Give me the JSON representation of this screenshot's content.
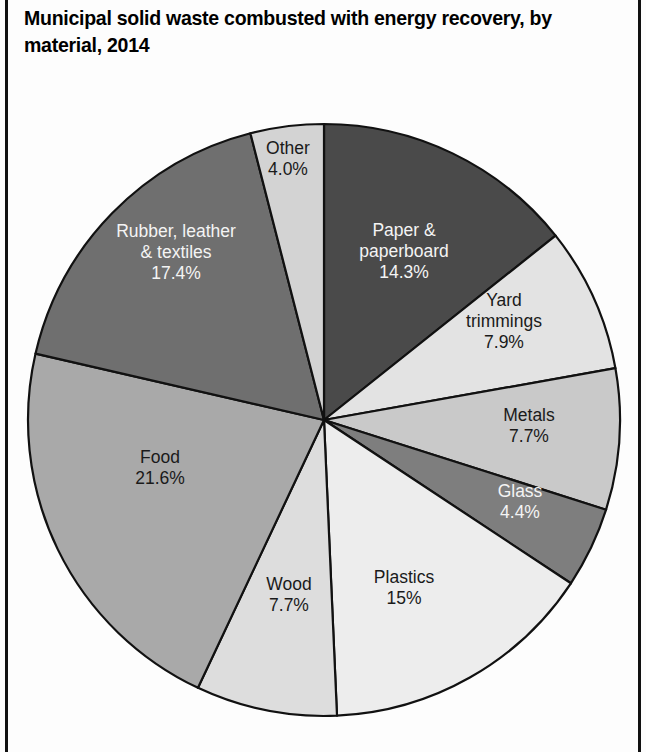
{
  "title": "Municipal solid waste combusted with energy recovery, by material, 2014",
  "chart_data": {
    "type": "pie",
    "title": "Municipal solid waste combusted with energy recovery, by material, 2014",
    "xlabel": "",
    "ylabel": "",
    "legend": "none",
    "start_angle_deg": 0,
    "direction": "clockwise",
    "units": "percent",
    "categories": [
      "Paper & paperboard",
      "Yard trimmings",
      "Metals",
      "Glass",
      "Plastics",
      "Wood",
      "Food",
      "Rubber, leather & textiles",
      "Other"
    ],
    "values": [
      14.3,
      7.9,
      7.7,
      4.4,
      15.0,
      7.7,
      21.6,
      17.4,
      4.0
    ],
    "slices": [
      {
        "name": "Paper & paperboard",
        "label_lines": [
          "Paper &",
          "paperboard"
        ],
        "value": 14.3,
        "value_label": "14.3%",
        "color": "#4a4a4a",
        "text_color": "light",
        "label_x": 404,
        "label_y": 252
      },
      {
        "name": "Yard trimmings",
        "label_lines": [
          "Yard",
          "trimmings"
        ],
        "value": 7.9,
        "value_label": "7.9%",
        "color": "#e3e3e3",
        "text_color": "dark",
        "label_x": 504,
        "label_y": 322
      },
      {
        "name": "Metals",
        "label_lines": [
          "Metals"
        ],
        "value": 7.7,
        "value_label": "7.7%",
        "color": "#c9c9c9",
        "text_color": "dark",
        "label_x": 529,
        "label_y": 426
      },
      {
        "name": "Glass",
        "label_lines": [
          "Glass"
        ],
        "value": 4.4,
        "value_label": "4.4%",
        "color": "#7e7e7e",
        "text_color": "light",
        "label_x": 520,
        "label_y": 502
      },
      {
        "name": "Plastics",
        "label_lines": [
          "Plastics"
        ],
        "value": 15.0,
        "value_label": "15%",
        "color": "#ededed",
        "text_color": "dark",
        "label_x": 404,
        "label_y": 588
      },
      {
        "name": "Wood",
        "label_lines": [
          "Wood"
        ],
        "value": 7.7,
        "value_label": "7.7%",
        "color": "#dddddd",
        "text_color": "dark",
        "label_x": 289,
        "label_y": 595
      },
      {
        "name": "Food",
        "label_lines": [
          "Food"
        ],
        "value": 21.6,
        "value_label": "21.6%",
        "color": "#a9a9a9",
        "text_color": "dark",
        "label_x": 160,
        "label_y": 468
      },
      {
        "name": "Rubber, leather & textiles",
        "label_lines": [
          "Rubber, leather",
          "& textiles"
        ],
        "value": 17.4,
        "value_label": "17.4%",
        "color": "#6f6f6f",
        "text_color": "light",
        "label_x": 176,
        "label_y": 253
      },
      {
        "name": "Other",
        "label_lines": [
          "Other"
        ],
        "value": 4.0,
        "value_label": "4.0%",
        "color": "#d3d3d3",
        "text_color": "dark",
        "label_x": 288,
        "label_y": 159
      }
    ],
    "geometry": {
      "center_x": 324,
      "center_y": 420,
      "radius": 296
    }
  }
}
